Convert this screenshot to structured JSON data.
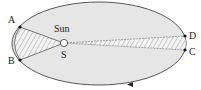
{
  "diagram": {
    "labels": {
      "sun": "Sun",
      "s": "S",
      "a": "A",
      "b": "B",
      "c": "C",
      "d": "D"
    },
    "colors": {
      "ellipse_fill": "#e6e6e6",
      "outline": "#444444",
      "hatch": "#9a9a9a",
      "points": "#111111"
    }
  }
}
